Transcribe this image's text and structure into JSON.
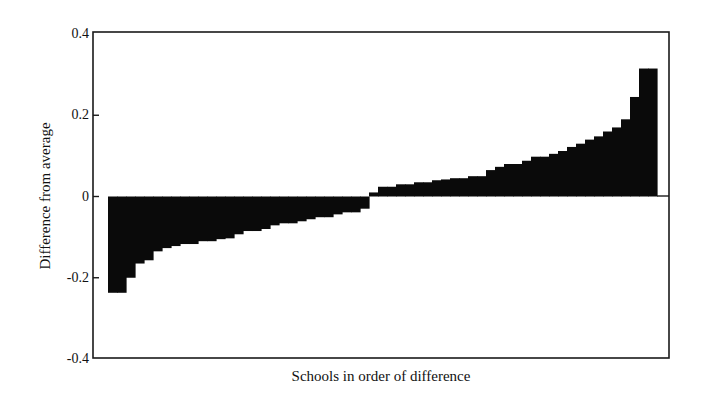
{
  "chart_data": {
    "type": "bar",
    "title": "",
    "xlabel": "Schools in order of difference",
    "ylabel": "Difference from average",
    "ylim": [
      -0.4,
      0.4
    ],
    "yticks": [
      0.4,
      0.2,
      0,
      -0.2,
      -0.4
    ],
    "ytick_labels": [
      "0.4",
      "0.2",
      "0",
      "-0.2",
      "-0.4"
    ],
    "grid": false,
    "legend": null,
    "bar_color": "#0a0a0a",
    "categories_description": "Schools sorted ascending by difference from average (unlabeled x ticks)",
    "values": [
      -0.237,
      -0.237,
      -0.2,
      -0.165,
      -0.157,
      -0.135,
      -0.127,
      -0.122,
      -0.117,
      -0.117,
      -0.11,
      -0.11,
      -0.105,
      -0.103,
      -0.093,
      -0.085,
      -0.085,
      -0.08,
      -0.071,
      -0.066,
      -0.066,
      -0.061,
      -0.056,
      -0.051,
      -0.051,
      -0.044,
      -0.039,
      -0.039,
      -0.03,
      0.01,
      0.024,
      0.024,
      0.03,
      0.03,
      0.035,
      0.035,
      0.04,
      0.042,
      0.045,
      0.045,
      0.05,
      0.05,
      0.065,
      0.073,
      0.08,
      0.08,
      0.088,
      0.098,
      0.098,
      0.105,
      0.112,
      0.122,
      0.13,
      0.14,
      0.148,
      0.16,
      0.17,
      0.19,
      0.245,
      0.315,
      0.315
    ]
  }
}
